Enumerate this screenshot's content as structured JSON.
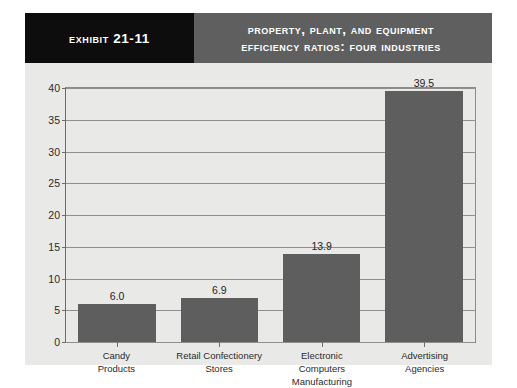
{
  "exhibit": {
    "tag": "Exhibit 21-11",
    "title_line1": "Property, Plant, and Equipment",
    "title_line2": "Efficiency Ratios: Four Industries",
    "colors": {
      "tag_bg": "#0d0d0d",
      "title_bg": "#5f5f5f",
      "panel_bg": "#e9e9e7",
      "bar": "#5e5e5e",
      "grid": "#8f8f8f"
    }
  },
  "chart_data": {
    "type": "bar",
    "title": "Property, Plant, and Equipment Efficiency Ratios: Four Industries",
    "xlabel": "",
    "ylabel": "",
    "categories": [
      "Candy Products",
      "Retail Confectionery Stores",
      "Electronic Computers Manufacturing",
      "Advertising Agencies"
    ],
    "category_lines": [
      [
        "Candy",
        "Products"
      ],
      [
        "Retail Confectionery",
        "Stores"
      ],
      [
        "Electronic",
        "Computers Manufacturing"
      ],
      [
        "Advertising",
        "Agencies"
      ]
    ],
    "values": [
      6.0,
      6.9,
      13.9,
      39.5
    ],
    "value_labels": [
      "6.0",
      "6.9",
      "13.9",
      "39.5"
    ],
    "ylim": [
      0,
      40
    ],
    "yticks": [
      0,
      5,
      10,
      15,
      20,
      25,
      30,
      35,
      40
    ],
    "ytick_labels": [
      "0",
      "5",
      "10",
      "15",
      "20",
      "25",
      "30",
      "35",
      "40"
    ],
    "grid": true,
    "legend": false
  }
}
